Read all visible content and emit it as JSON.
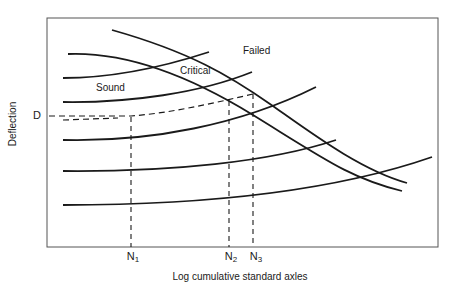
{
  "diagram": {
    "title": "",
    "y_axis_label": "Deflection",
    "x_axis_label": "Log cumulative standard axles",
    "deflection_marker": "D",
    "x_markers": [
      {
        "id": "N1",
        "base": "N",
        "sub": "1",
        "x": 131
      },
      {
        "id": "N2",
        "base": "N",
        "sub": "2",
        "x": 229
      },
      {
        "id": "N3",
        "base": "N",
        "sub": "3",
        "x": 253
      }
    ],
    "regions": [
      {
        "name": "Sound",
        "label": "Sound"
      },
      {
        "name": "Critical",
        "label": "Critical"
      },
      {
        "name": "Failed",
        "label": "Failed"
      }
    ],
    "colors": {
      "line": "#1a1a1a",
      "frame": "#555555",
      "background": "#ffffff"
    }
  }
}
